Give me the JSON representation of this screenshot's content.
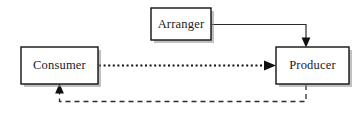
{
  "diagram": {
    "background_color": "#ffffff",
    "width": 362,
    "height": 115,
    "nodes": [
      {
        "id": "arranger",
        "label": "Arranger",
        "shape": "rectangle",
        "x": 151,
        "y": 8,
        "width": 60,
        "height": 32,
        "fill": "#ffffff",
        "border_color": "#111111",
        "has_drop_shadow": true
      },
      {
        "id": "consumer",
        "label": "Consumer",
        "shape": "rectangle",
        "x": 21,
        "y": 47,
        "width": 77,
        "height": 37,
        "fill": "#ffffff",
        "border_color": "#111111",
        "has_drop_shadow": true
      },
      {
        "id": "producer",
        "label": "Producer",
        "shape": "rectangle",
        "x": 276,
        "y": 47,
        "width": 73,
        "height": 37,
        "fill": "#ffffff",
        "border_color": "#111111",
        "has_drop_shadow": true
      }
    ],
    "edges": [
      {
        "id": "arranger-to-producer",
        "from": "arranger",
        "to": "producer",
        "style": "solid",
        "arrow": true,
        "arrow_at": "target",
        "routing": "orthogonal-right-then-down",
        "color": "#2b2b2b"
      },
      {
        "id": "consumer-to-producer",
        "from": "consumer",
        "to": "producer",
        "style": "dotted",
        "arrow": true,
        "arrow_at": "target",
        "routing": "straight-horizontal",
        "color": "#111111"
      },
      {
        "id": "producer-to-consumer",
        "from": "producer",
        "to": "consumer",
        "style": "dashed",
        "arrow": true,
        "arrow_at": "target",
        "routing": "orthogonal-down-left-up",
        "color": "#2b2b2b"
      }
    ]
  }
}
